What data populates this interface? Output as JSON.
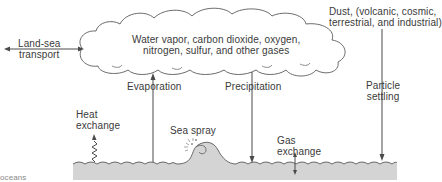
{
  "diagram": {
    "title": "",
    "atmosphere_label": {
      "line1": "Water vapor, carbon dioxide, oxygen,",
      "line2": "nitrogen, sulfur, and other gases"
    },
    "dust_label": {
      "line1": "Dust, (volcanic, cosmic,",
      "line2": "terrestrial, and industrial)"
    },
    "processes": [
      {
        "id": "land-sea-transport",
        "line1": "Land-sea",
        "line2": "transport",
        "direction": "bidirectional-horizontal"
      },
      {
        "id": "heat-exchange",
        "line1": "Heat",
        "line2": "exchange",
        "direction": "up-wavy"
      },
      {
        "id": "evaporation",
        "line1": "Evaporation",
        "line2": "",
        "direction": "up"
      },
      {
        "id": "sea-spray",
        "line1": "Sea spray",
        "line2": "",
        "direction": "wave"
      },
      {
        "id": "precipitation",
        "line1": "Precipitation",
        "line2": "",
        "direction": "down"
      },
      {
        "id": "gas-exchange",
        "line1": "Gas",
        "line2": "exchange",
        "direction": "bidirectional-vertical"
      },
      {
        "id": "particle-settling",
        "line1": "Particle",
        "line2": "settling",
        "direction": "down"
      }
    ],
    "footer_fragment": "oceans",
    "colors": {
      "line": "#4a4a4a",
      "sea_fill": "#d4d4d4",
      "text": "#3a3a3a",
      "background": "#ffffff"
    }
  }
}
